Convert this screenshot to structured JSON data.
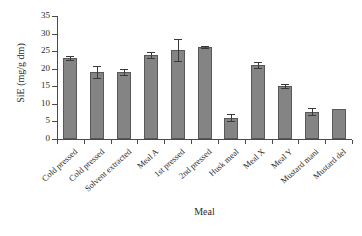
{
  "chart_data": {
    "type": "bar",
    "title": "",
    "xlabel": "Meal",
    "ylabel": "SiE (mg/g dm)",
    "categories": [
      "Cold pressed",
      "Cold pressed",
      "Solvent extracted",
      "Meal A",
      "1st pressed",
      "2nd pressed",
      "Husk meal",
      "Meal X",
      "Meal Y",
      "Mustard mani",
      "Mustard del"
    ],
    "values": [
      23.1,
      19.1,
      19.0,
      23.9,
      25.3,
      26.2,
      6.0,
      21.0,
      15.0,
      7.8,
      8.6
    ],
    "errors": [
      0.6,
      1.8,
      0.8,
      0.8,
      3.1,
      0.3,
      1.0,
      0.8,
      0.6,
      1.0,
      0.0
    ],
    "ylim": [
      0,
      35
    ],
    "ytick_labels": [
      "0",
      "5",
      "10",
      "15",
      "20",
      "25",
      "30",
      "35"
    ],
    "ytick_values": [
      0,
      5,
      10,
      15,
      20,
      25,
      30,
      35
    ],
    "grid": false,
    "legend": false,
    "bar_color": "#848484",
    "bar_edge_color": "#585858",
    "axis_color": "#4a4a4a",
    "error_bar_color": "#3a3a3a",
    "background": "#ffffff"
  }
}
